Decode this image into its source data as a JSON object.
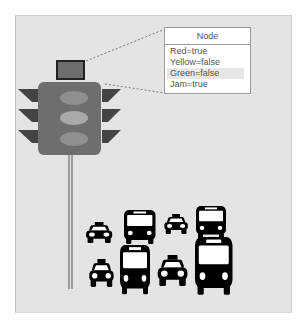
{
  "diagram": {
    "node": {
      "title": "Node",
      "attributes": [
        {
          "label": "Red=true",
          "highlighted": false
        },
        {
          "label": "Yellow=false",
          "highlighted": false
        },
        {
          "label": "Green=false",
          "highlighted": true
        },
        {
          "label": "Jam=true",
          "highlighted": false
        }
      ]
    },
    "traffic_light": {
      "lamps": [
        "red",
        "yellow",
        "green"
      ],
      "sensor_box": "sensor"
    },
    "vehicles": {
      "top_row": [
        "taxi",
        "bus",
        "taxi",
        "bus"
      ],
      "bottom_row": [
        "taxi",
        "bus",
        "taxi",
        "bus"
      ]
    },
    "colors": {
      "background": "#e4e4e4",
      "light_body": "#6e6e6e",
      "visor": "#444444",
      "lamp": "#9b9b9b",
      "vehicle": "#000000",
      "dashed_line": "#7a7a7a"
    }
  }
}
